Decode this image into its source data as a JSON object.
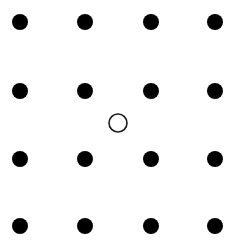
{
  "canvas": {
    "width": 237,
    "height": 244,
    "background_color": "#ffffff"
  },
  "figure": {
    "dot_color": "#000000",
    "open_circle_fill": "#ffffff",
    "open_circle_stroke": "#1a1a1a"
  },
  "chart_data": {
    "type": "scatter",
    "title": "",
    "subtitle": "",
    "xlabel": "",
    "ylabel": "",
    "xlim": [
      0,
      237
    ],
    "ylim": [
      0,
      244
    ],
    "grid": false,
    "legend": false,
    "legend_position": "none",
    "axes_visible": false,
    "tick_labels_x": [],
    "tick_labels_y": [],
    "annotations": [],
    "grid_columns_x": [
      20,
      85,
      151,
      215
    ],
    "grid_rows_y": [
      22,
      91,
      159,
      226
    ],
    "series": [
      {
        "name": "filled-dots",
        "marker": "circle-filled",
        "color": "#000000",
        "radius": 8,
        "count": 16,
        "points": [
          {
            "x": 20,
            "y": 22,
            "row": 1,
            "col": 1
          },
          {
            "x": 85,
            "y": 22,
            "row": 1,
            "col": 2
          },
          {
            "x": 151,
            "y": 22,
            "row": 1,
            "col": 3
          },
          {
            "x": 215,
            "y": 22,
            "row": 1,
            "col": 4
          },
          {
            "x": 20,
            "y": 91,
            "row": 2,
            "col": 1
          },
          {
            "x": 85,
            "y": 91,
            "row": 2,
            "col": 2
          },
          {
            "x": 151,
            "y": 91,
            "row": 2,
            "col": 3
          },
          {
            "x": 215,
            "y": 91,
            "row": 2,
            "col": 4
          },
          {
            "x": 20,
            "y": 159,
            "row": 3,
            "col": 1
          },
          {
            "x": 85,
            "y": 159,
            "row": 3,
            "col": 2
          },
          {
            "x": 151,
            "y": 159,
            "row": 3,
            "col": 3
          },
          {
            "x": 215,
            "y": 159,
            "row": 3,
            "col": 4
          },
          {
            "x": 20,
            "y": 226,
            "row": 4,
            "col": 1
          },
          {
            "x": 85,
            "y": 226,
            "row": 4,
            "col": 2
          },
          {
            "x": 151,
            "y": 226,
            "row": 4,
            "col": 3
          },
          {
            "x": 215,
            "y": 226,
            "row": 4,
            "col": 4
          }
        ]
      },
      {
        "name": "open-circle",
        "marker": "circle-open",
        "color": "#1a1a1a",
        "fill": "#ffffff",
        "radius": 9,
        "stroke_width": 1.6,
        "count": 1,
        "points": [
          {
            "x": 118,
            "y": 123
          }
        ]
      }
    ]
  }
}
